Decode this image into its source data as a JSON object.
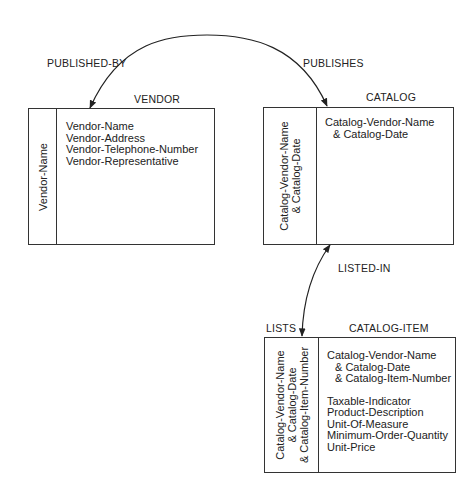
{
  "relationships": {
    "published_by": "PUBLISHED-BY",
    "publishes": "PUBLISHES",
    "listed_in": "LISTED-IN",
    "lists": "LISTS"
  },
  "entities": {
    "vendor": {
      "name": "VENDOR",
      "key": [
        "Vendor-Name"
      ],
      "attributes": [
        "Vendor-Name",
        "Vendor-Address",
        "Vendor-Telephone-Number",
        "Vendor-Representative"
      ]
    },
    "catalog": {
      "name": "CATALOG",
      "key": [
        "Catalog-Vendor-Name",
        "& Catalog-Date"
      ],
      "attributes": [
        "Catalog-Vendor-Name",
        "& Catalog-Date"
      ]
    },
    "catalog_item": {
      "name": "CATALOG-ITEM",
      "key": [
        "Catalog-Vendor-Name",
        "& Catalog-Date",
        "& Catalog-Item-Number"
      ],
      "key_attributes": [
        "Catalog-Vendor-Name",
        "& Catalog-Date",
        "& Catalog-Item-Number"
      ],
      "attributes": [
        "Taxable-Indicator",
        "Product-Description",
        "Unit-Of-Measure",
        "Minimum-Order-Quantity",
        "Unit-Price"
      ]
    }
  },
  "colors": {
    "line": "#333333",
    "text": "#222222",
    "background": "#ffffff"
  }
}
